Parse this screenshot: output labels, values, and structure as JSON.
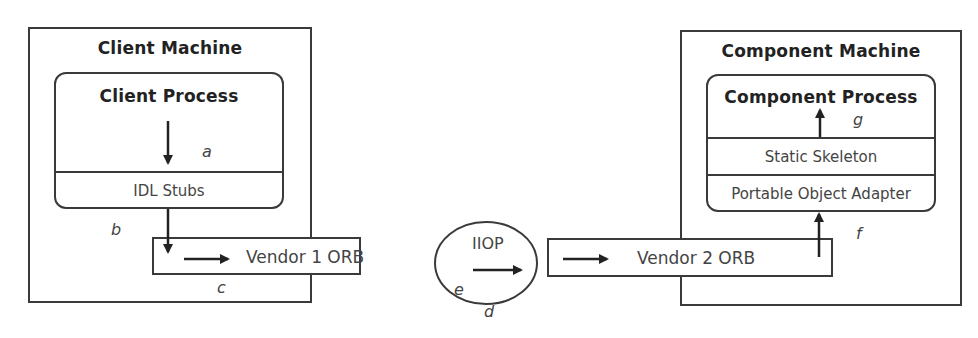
{
  "diagram": {
    "type": "corba-interoperability",
    "client_machine": {
      "title": "Client Machine",
      "process": {
        "title": "Client Process",
        "layers": [
          "IDL Stubs"
        ]
      },
      "orb": "Vendor 1 ORB"
    },
    "protocol": {
      "label": "IIOP"
    },
    "component_machine": {
      "title": "Component Machine",
      "process": {
        "title": "Component Process",
        "layers": [
          "Static Skeleton",
          "Portable Object Adapter"
        ]
      },
      "orb": "Vendor 2 ORB"
    },
    "step_labels": {
      "a": "a",
      "b": "b",
      "c": "c",
      "d": "d",
      "e": "e",
      "f": "f",
      "g": "g"
    },
    "flow": [
      {
        "step": "a",
        "from": "Client Process",
        "to": "IDL Stubs"
      },
      {
        "step": "b",
        "from": "IDL Stubs",
        "to": "Vendor 1 ORB"
      },
      {
        "step": "c",
        "from": "Vendor 1 ORB",
        "to": "IIOP"
      },
      {
        "step": "d",
        "from": "IIOP",
        "to": "Vendor 2 ORB"
      },
      {
        "step": "e",
        "from": "Vendor 2 ORB",
        "to": "Portable Object Adapter"
      },
      {
        "step": "f",
        "from": "Vendor 2 ORB",
        "to": "Portable Object Adapter"
      },
      {
        "step": "g",
        "from": "Static Skeleton",
        "to": "Component Process"
      }
    ],
    "colors": {
      "stroke": "#3a3a3a",
      "text": "#444444",
      "background": "#ffffff"
    }
  }
}
